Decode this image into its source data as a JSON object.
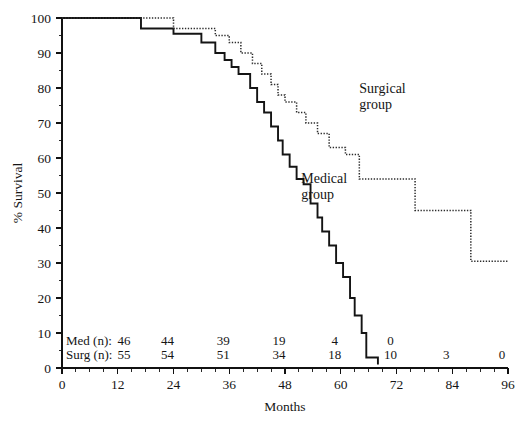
{
  "chart_data": {
    "type": "line",
    "title": "",
    "subtitle": "",
    "xlabel": "Months",
    "ylabel": "% Survival",
    "xlim": [
      0,
      96
    ],
    "ylim": [
      0,
      100
    ],
    "xticks": [
      0,
      12,
      24,
      36,
      48,
      60,
      72,
      84,
      96
    ],
    "xtick_labels": [
      "0",
      "12",
      "24",
      "36",
      "48",
      "60",
      "72",
      "84",
      "96"
    ],
    "yticks": [
      0,
      10,
      20,
      30,
      40,
      50,
      60,
      70,
      80,
      90,
      100
    ],
    "ytick_labels": [
      "0",
      "10",
      "20",
      "30",
      "40",
      "50",
      "60",
      "70",
      "80",
      "90",
      "100"
    ],
    "x_minor_tick_interval": 3,
    "grid": false,
    "legend_position": "inline-annotation",
    "series": [
      {
        "name": "Medical group",
        "style": "solid",
        "label": "Medical group",
        "label_line1": "Medical",
        "label_line2": "group",
        "points": [
          [
            0,
            100
          ],
          [
            17,
            100
          ],
          [
            17,
            97
          ],
          [
            24,
            97
          ],
          [
            24,
            95.5
          ],
          [
            30,
            95.5
          ],
          [
            30,
            93
          ],
          [
            33,
            93
          ],
          [
            33,
            90
          ],
          [
            35,
            90
          ],
          [
            35,
            88
          ],
          [
            36.5,
            88
          ],
          [
            36.5,
            86
          ],
          [
            38,
            86
          ],
          [
            38,
            84
          ],
          [
            40.5,
            84
          ],
          [
            40.5,
            80
          ],
          [
            42,
            80
          ],
          [
            42,
            76
          ],
          [
            43.5,
            76
          ],
          [
            43.5,
            73
          ],
          [
            45,
            73
          ],
          [
            45,
            69
          ],
          [
            46.5,
            69
          ],
          [
            46.5,
            65
          ],
          [
            47.5,
            65
          ],
          [
            47.5,
            61
          ],
          [
            49,
            61
          ],
          [
            49,
            57.5
          ],
          [
            50.5,
            57.5
          ],
          [
            50.5,
            54
          ],
          [
            52,
            54
          ],
          [
            52,
            52.5
          ],
          [
            53.5,
            52.5
          ],
          [
            53.5,
            47
          ],
          [
            55,
            47
          ],
          [
            55,
            43
          ],
          [
            56,
            43
          ],
          [
            56,
            39
          ],
          [
            57.5,
            39
          ],
          [
            57.5,
            35
          ],
          [
            59,
            35
          ],
          [
            59,
            30
          ],
          [
            60.5,
            30
          ],
          [
            60.5,
            26
          ],
          [
            62,
            26
          ],
          [
            62,
            20
          ],
          [
            63,
            20
          ],
          [
            63,
            15
          ],
          [
            64.5,
            15
          ],
          [
            64.5,
            10
          ],
          [
            65.5,
            10
          ],
          [
            65.5,
            3
          ],
          [
            68,
            3
          ],
          [
            68,
            1
          ]
        ]
      },
      {
        "name": "Surgical group",
        "style": "dotted",
        "label": "Surgical group",
        "label_line1": "Surgical",
        "label_line2": "group",
        "points": [
          [
            0,
            100
          ],
          [
            24,
            100
          ],
          [
            24,
            97
          ],
          [
            33,
            97
          ],
          [
            33,
            95
          ],
          [
            36,
            95
          ],
          [
            36,
            93
          ],
          [
            38.5,
            93
          ],
          [
            38.5,
            90
          ],
          [
            41,
            90
          ],
          [
            41,
            87
          ],
          [
            43,
            87
          ],
          [
            43,
            84
          ],
          [
            45,
            84
          ],
          [
            45,
            81
          ],
          [
            46.5,
            81
          ],
          [
            46.5,
            78
          ],
          [
            48,
            78
          ],
          [
            48,
            76
          ],
          [
            50.5,
            76
          ],
          [
            50.5,
            73
          ],
          [
            52.5,
            73
          ],
          [
            52.5,
            70
          ],
          [
            55,
            70
          ],
          [
            55,
            67
          ],
          [
            57.5,
            67
          ],
          [
            57.5,
            63
          ],
          [
            61,
            63
          ],
          [
            61,
            61
          ],
          [
            64,
            61
          ],
          [
            64,
            54
          ],
          [
            76,
            54
          ],
          [
            76,
            45
          ],
          [
            88,
            45
          ],
          [
            88,
            30.5
          ],
          [
            96,
            30.5
          ]
        ]
      }
    ],
    "risk_table": {
      "rows": [
        {
          "label": "Med (n):",
          "values": [
            "46",
            "44",
            "39",
            "19",
            "4",
            "0",
            "",
            ""
          ],
          "at_months": [
            0,
            24,
            36,
            48,
            60,
            72,
            84,
            96
          ]
        },
        {
          "label": "Surg (n):",
          "values": [
            "55",
            "54",
            "51",
            "34",
            "18",
            "10",
            "3",
            "0"
          ],
          "at_months": [
            0,
            24,
            36,
            48,
            60,
            72,
            84,
            96
          ]
        }
      ]
    },
    "colors": {
      "axis": "#111111",
      "medical_curve": "#141414",
      "surgical_curve": "#2b2b2b",
      "background": "#ffffff",
      "text": "#151515"
    }
  }
}
